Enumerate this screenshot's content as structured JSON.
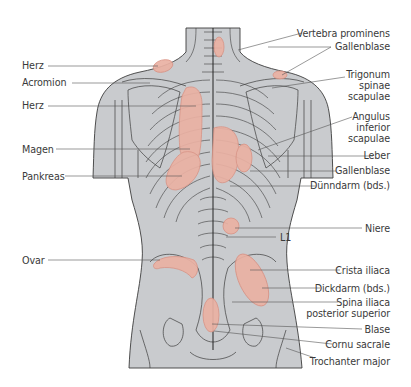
{
  "figure": {
    "colors": {
      "body_fill": "#c9cbce",
      "body_outline": "#3c3c3c",
      "zone_fill": "#eab1a3",
      "zone_stroke": "#d98f80",
      "leader_line": "#555555",
      "label_text": "#3a3a3a"
    },
    "labels_left": [
      {
        "id": "herz-1",
        "text": "Herz",
        "x": 22,
        "y": 60
      },
      {
        "id": "acromion",
        "text": "Acromion",
        "x": 22,
        "y": 77
      },
      {
        "id": "herz-2",
        "text": "Herz",
        "x": 22,
        "y": 100
      },
      {
        "id": "magen",
        "text": "Magen",
        "x": 22,
        "y": 144
      },
      {
        "id": "pankreas",
        "text": "Pankreas",
        "x": 22,
        "y": 171
      },
      {
        "id": "ovar",
        "text": "Ovar",
        "x": 22,
        "y": 255
      }
    ],
    "labels_right": [
      {
        "id": "vertebra-prominens",
        "text": "Vertebra prominens",
        "right": 390,
        "y": 28
      },
      {
        "id": "gallenblase-1",
        "text": "Gallenblase",
        "right": 390,
        "y": 41
      },
      {
        "id": "trigonum-spinae-scapulae",
        "text": "Trigonum\nspinae\nscapulae",
        "right": 390,
        "y": 69
      },
      {
        "id": "angulus-inferior-scapulae",
        "text": "Angulus\ninferior\nscapulae",
        "right": 390,
        "y": 111
      },
      {
        "id": "leber",
        "text": "Leber",
        "right": 390,
        "y": 150
      },
      {
        "id": "gallenblase-2",
        "text": "Gallenblase",
        "right": 390,
        "y": 165
      },
      {
        "id": "duenndarm",
        "text": "Dünndarm (bds.)",
        "right": 390,
        "y": 180
      },
      {
        "id": "niere",
        "text": "Niere",
        "right": 390,
        "y": 223
      },
      {
        "id": "l1",
        "text": "L1",
        "left": 280,
        "y": 233
      },
      {
        "id": "crista-iliaca",
        "text": "Crista iliaca",
        "right": 390,
        "y": 265
      },
      {
        "id": "dickdarm",
        "text": "Dickdarm (bds.)",
        "right": 390,
        "y": 284
      },
      {
        "id": "spina-iliaca-posterior-superior",
        "text": "Spina iliaca\nposterior superior",
        "right": 390,
        "y": 298
      },
      {
        "id": "blase",
        "text": "Blase",
        "right": 390,
        "y": 324
      },
      {
        "id": "cornu-sacrale",
        "text": "Cornu sacrale",
        "right": 390,
        "y": 339
      },
      {
        "id": "trochanter-major",
        "text": "Trochanter major",
        "right": 390,
        "y": 357
      }
    ]
  }
}
